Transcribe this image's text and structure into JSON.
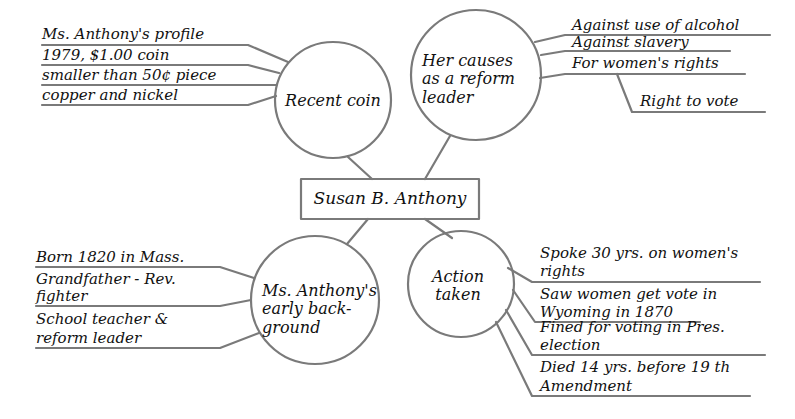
{
  "diagram": {
    "type": "mind-map",
    "line_color": "#7a7a7a",
    "text_color": "#111111",
    "center": {
      "label": "Susan B. Anthony"
    },
    "nodes": [
      {
        "id": "recent-coin",
        "label": "Recent coin",
        "position": "top-left",
        "details": [
          "Ms. Anthony's profile",
          "1979, $1.00 coin",
          "smaller than 50¢ piece",
          "copper and nickel"
        ]
      },
      {
        "id": "causes",
        "label": "Her causes as a reform leader",
        "position": "top-right",
        "details": [
          "Against use of alcohol",
          "Against slavery",
          "For women's rights"
        ],
        "sub_details": [
          "Right to vote"
        ]
      },
      {
        "id": "early-background",
        "label": "Ms. Anthony's early back-ground",
        "position": "bottom-left",
        "details": [
          "Born 1820 in Mass.",
          "Grandfather - Rev. fighter",
          "School teacher & reform leader"
        ]
      },
      {
        "id": "action-taken",
        "label": "Action taken",
        "position": "bottom-right",
        "details": [
          "Spoke 30 yrs. on women's rights",
          "Saw women get vote in Wyoming in 1870",
          "Fined for voting in Pres. election",
          "Died 14 yrs. before 19 th Amendment"
        ]
      }
    ]
  },
  "text": {
    "center": "Susan B. Anthony",
    "coin": {
      "node": "Recent coin",
      "d1": "Ms. Anthony's profile",
      "d2": "1979, $1.00 coin",
      "d3": "smaller than 50¢ piece",
      "d4": "copper and nickel"
    },
    "causes": {
      "node_l1": "Her causes",
      "node_l2": "as a reform",
      "node_l3": "leader",
      "d1": "Against use of alcohol",
      "d2": "Against slavery",
      "d3": "For women's rights",
      "d3a": "Right to vote"
    },
    "early": {
      "node_l1": "Ms. Anthony's",
      "node_l2": "early back-",
      "node_l3": "ground",
      "d1": "Born 1820 in Mass.",
      "d2a": "Grandfather - Rev.",
      "d2b": "fighter",
      "d3a": "School teacher &",
      "d3b": "reform leader"
    },
    "action": {
      "node_l1": "Action",
      "node_l2": "taken",
      "d1a": "Spoke 30 yrs. on women's",
      "d1b": "rights",
      "d2a": "Saw women get vote in",
      "d2b": "Wyoming in 1870",
      "d3a": "Fined for voting in Pres.",
      "d3b": "election",
      "d4a": "Died 14 yrs. before 19 th",
      "d4b": "Amendment"
    }
  }
}
